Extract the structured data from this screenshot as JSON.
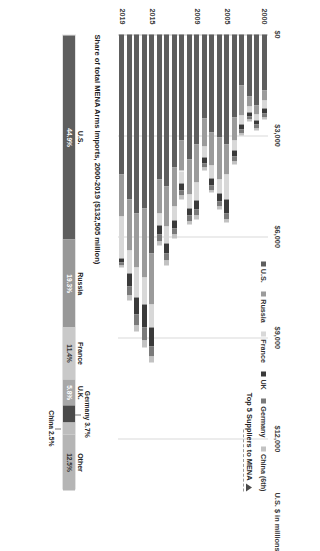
{
  "chart_data": {
    "type": "bar",
    "orientation": "vertical-stacked",
    "title": "Share of total MENA Arms Imports, 2000-2019 ($132,505 million)",
    "ylabel": "U.S. $ in millions",
    "xlabel": "",
    "ylim": [
      0,
      13500
    ],
    "yticks": [
      "$0",
      "$3,000",
      "$6,000",
      "$9,000",
      "$12,000"
    ],
    "ytick_values": [
      0,
      3000,
      6000,
      9000,
      12000
    ],
    "grid": true,
    "legend_position": "top-right",
    "legend_title": "Top 5 Suppliers to MENA",
    "legend": [
      "U.S.",
      "Russia",
      "France",
      "UK",
      "Germany",
      "China (6th)"
    ],
    "colors": [
      "#5e5e5e",
      "#9b9b9b",
      "#d8d8d8",
      "#3a3a3a",
      "#7a7a7a",
      "#c2c2c2"
    ],
    "categories": [
      2000,
      2001,
      2002,
      2003,
      2004,
      2005,
      2006,
      2007,
      2008,
      2009,
      2010,
      2011,
      2012,
      2013,
      2014,
      2015,
      2016,
      2017,
      2018,
      2019
    ],
    "xtick_labels": [
      "2000",
      "2005",
      "2009",
      "2015",
      "2019"
    ],
    "xtick_index": [
      0,
      5,
      9,
      15,
      19
    ],
    "series": [
      {
        "name": "U.S.",
        "values": [
          1650,
          2100,
          1850,
          1500,
          2450,
          3250,
          3050,
          2900,
          2500,
          3250,
          3700,
          3150,
          3950,
          4500,
          4300,
          6500,
          5150,
          5300,
          4900,
          4150
        ]
      },
      {
        "name": "Russia",
        "values": [
          320,
          260,
          300,
          900,
          700,
          900,
          1250,
          1000,
          820,
          1150,
          1050,
          900,
          1150,
          1200,
          1000,
          1500,
          2050,
          1600,
          1500,
          1250
        ]
      },
      {
        "name": "France",
        "values": [
          220,
          180,
          160,
          260,
          300,
          750,
          420,
          380,
          330,
          520,
          400,
          380,
          420,
          500,
          380,
          700,
          800,
          900,
          700,
          1250
        ]
      },
      {
        "name": "UK",
        "values": [
          160,
          140,
          120,
          150,
          180,
          400,
          230,
          200,
          180,
          260,
          220,
          200,
          240,
          300,
          260,
          560,
          700,
          520,
          380,
          110
        ]
      },
      {
        "name": "Germany",
        "values": [
          120,
          110,
          100,
          120,
          140,
          180,
          160,
          140,
          130,
          200,
          170,
          160,
          180,
          220,
          200,
          300,
          380,
          300,
          260,
          90
        ]
      },
      {
        "name": "China (6th)",
        "values": [
          60,
          50,
          55,
          70,
          80,
          90,
          85,
          80,
          75,
          110,
          100,
          95,
          110,
          130,
          120,
          180,
          220,
          190,
          160,
          70
        ]
      }
    ]
  },
  "share_bar": {
    "title": "Share of total MENA Arms Imports, 2000-2019 ($132,505 million)",
    "total_label": "$132,505 million",
    "segments": [
      {
        "name": "U.S.",
        "value": "44.9%",
        "pct": 44.9,
        "color": "#5e5e5e",
        "text_color": "#ffffff"
      },
      {
        "name": "Russia",
        "value": "19.3%",
        "pct": 19.3,
        "color": "#989898",
        "text_color": "#ffffff"
      },
      {
        "name": "France",
        "value": "11.4%",
        "pct": 11.4,
        "color": "#c9c9c9",
        "text_color": "#333333"
      },
      {
        "name": "U.K.",
        "value": "5.8%",
        "pct": 5.8,
        "color": "#a8a8a8",
        "text_color": "#ffffff"
      },
      {
        "name": "Germany",
        "value": "3.7%",
        "pct": 3.7,
        "color": "#4a4a4a",
        "text_color": "#ffffff"
      },
      {
        "name": "China",
        "value": "2.5%",
        "pct": 2.5,
        "color": "#bdbdbd",
        "text_color": "#333333"
      },
      {
        "name": "Other",
        "value": "12.5%",
        "pct": 12.5,
        "color": "#b5b5b5",
        "text_color": "#333333"
      }
    ],
    "outside_labels": {
      "germany": "Germany 3.7%",
      "china": "China 2.5%"
    }
  },
  "legend_header": {
    "text": "Top 5 Suppliers to MENA",
    "marker": "up-triangle"
  }
}
